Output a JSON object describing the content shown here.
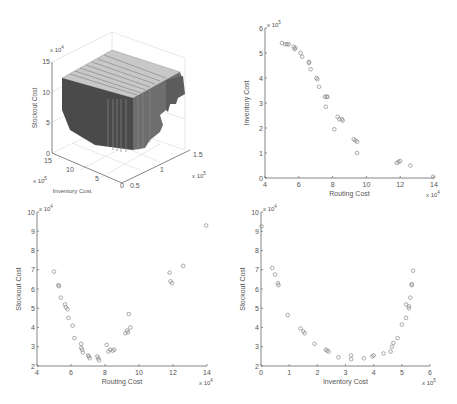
{
  "chart_data": [
    {
      "type": "surface3d",
      "title": "",
      "xlabel": "Inventory Cost",
      "ylabel": "Routing Cost",
      "zlabel": "Stockout Cost",
      "x_ticks": [
        "0",
        "5",
        "10",
        "15"
      ],
      "x_exponent": "x 10^5",
      "y_ticks": [
        "0.5",
        "1",
        "1.5"
      ],
      "y_exponent": "x 10^5",
      "z_ticks": [
        "0",
        "5",
        "10",
        "15"
      ],
      "z_exponent": "x 10^4",
      "grid": true,
      "description": "Stepped dark-gray 3D surface / block plot of Pareto front"
    },
    {
      "type": "scatter",
      "title": "",
      "xlabel": "Routing Cost",
      "ylabel": "Inventory Cost",
      "x_ticks": [
        "4",
        "6",
        "8",
        "10",
        "12",
        "14"
      ],
      "x_exponent": "x 10^4",
      "y_ticks": [
        "0",
        "1",
        "2",
        "3",
        "4",
        "5",
        "6"
      ],
      "y_exponent": "x 10^5",
      "xlim": [
        4,
        14
      ],
      "ylim": [
        0,
        6
      ],
      "grid": false,
      "marker": "circle-open",
      "points": [
        [
          5.0,
          5.4
        ],
        [
          5.2,
          5.35
        ],
        [
          5.3,
          5.35
        ],
        [
          5.4,
          5.35
        ],
        [
          5.7,
          5.25
        ],
        [
          5.8,
          5.2
        ],
        [
          5.75,
          5.15
        ],
        [
          6.1,
          5.0
        ],
        [
          6.2,
          4.85
        ],
        [
          6.6,
          4.65
        ],
        [
          6.6,
          4.6
        ],
        [
          6.7,
          4.35
        ],
        [
          7.05,
          4.0
        ],
        [
          7.1,
          3.95
        ],
        [
          7.2,
          3.65
        ],
        [
          7.55,
          3.25
        ],
        [
          7.65,
          3.25
        ],
        [
          7.7,
          3.25
        ],
        [
          7.6,
          2.85
        ],
        [
          8.3,
          2.45
        ],
        [
          8.4,
          2.35
        ],
        [
          8.55,
          2.35
        ],
        [
          8.6,
          2.3
        ],
        [
          8.1,
          1.95
        ],
        [
          9.25,
          1.55
        ],
        [
          9.35,
          1.5
        ],
        [
          9.45,
          1.45
        ],
        [
          9.45,
          1.0
        ],
        [
          11.8,
          0.6
        ],
        [
          11.9,
          0.65
        ],
        [
          12.0,
          0.68
        ],
        [
          12.6,
          0.5
        ],
        [
          13.95,
          0.05
        ]
      ]
    },
    {
      "type": "scatter",
      "title": "",
      "xlabel": "Routing Cost",
      "ylabel": "Stockout Cost",
      "x_ticks": [
        "4",
        "6",
        "8",
        "10",
        "12",
        "14"
      ],
      "x_exponent": "x 10^4",
      "y_ticks": [
        "2",
        "3",
        "4",
        "5",
        "6",
        "7",
        "8",
        "9",
        "10"
      ],
      "y_exponent": "x 10^4",
      "xlim": [
        4,
        14
      ],
      "ylim": [
        2,
        10
      ],
      "grid": false,
      "marker": "circle-open",
      "points": [
        [
          5.0,
          6.9
        ],
        [
          5.25,
          6.2
        ],
        [
          5.3,
          6.15
        ],
        [
          5.4,
          5.55
        ],
        [
          5.65,
          5.2
        ],
        [
          5.7,
          5.05
        ],
        [
          5.8,
          4.95
        ],
        [
          5.85,
          4.5
        ],
        [
          6.1,
          4.1
        ],
        [
          6.2,
          3.45
        ],
        [
          6.6,
          3.15
        ],
        [
          6.6,
          2.95
        ],
        [
          6.65,
          2.85
        ],
        [
          6.7,
          2.7
        ],
        [
          7.0,
          2.55
        ],
        [
          7.05,
          2.5
        ],
        [
          7.1,
          2.4
        ],
        [
          7.55,
          2.5
        ],
        [
          7.6,
          2.4
        ],
        [
          7.65,
          2.3
        ],
        [
          8.1,
          3.1
        ],
        [
          8.2,
          2.75
        ],
        [
          8.3,
          2.85
        ],
        [
          8.45,
          2.8
        ],
        [
          8.55,
          2.85
        ],
        [
          9.2,
          3.7
        ],
        [
          9.3,
          3.85
        ],
        [
          9.35,
          3.75
        ],
        [
          9.4,
          4.7
        ],
        [
          9.5,
          4.0
        ],
        [
          11.8,
          6.85
        ],
        [
          11.85,
          6.4
        ],
        [
          11.95,
          6.3
        ],
        [
          12.6,
          7.2
        ],
        [
          13.95,
          9.3
        ]
      ]
    },
    {
      "type": "scatter",
      "title": "",
      "xlabel": "Inventory Cost",
      "ylabel": "Stockout Cost",
      "x_ticks": [
        "0",
        "1",
        "2",
        "3",
        "4",
        "5",
        "6"
      ],
      "x_exponent": "x 10^5",
      "y_ticks": [
        "2",
        "3",
        "4",
        "5",
        "6",
        "7",
        "8",
        "9",
        "10"
      ],
      "y_exponent": "x 10^4",
      "xlim": [
        0,
        6
      ],
      "ylim": [
        2,
        10
      ],
      "grid": false,
      "marker": "circle-open",
      "points": [
        [
          0.02,
          9.25
        ],
        [
          0.4,
          7.1
        ],
        [
          0.5,
          6.75
        ],
        [
          0.6,
          6.3
        ],
        [
          0.62,
          6.2
        ],
        [
          0.95,
          4.65
        ],
        [
          1.4,
          3.95
        ],
        [
          1.5,
          3.8
        ],
        [
          1.55,
          3.7
        ],
        [
          1.9,
          3.15
        ],
        [
          2.3,
          2.85
        ],
        [
          2.35,
          2.8
        ],
        [
          2.4,
          2.75
        ],
        [
          2.75,
          2.45
        ],
        [
          3.2,
          2.55
        ],
        [
          3.2,
          2.35
        ],
        [
          3.65,
          2.4
        ],
        [
          3.95,
          2.5
        ],
        [
          4.0,
          2.55
        ],
        [
          4.35,
          2.65
        ],
        [
          4.6,
          2.75
        ],
        [
          4.65,
          3.0
        ],
        [
          4.7,
          3.2
        ],
        [
          4.85,
          3.45
        ],
        [
          5.0,
          4.15
        ],
        [
          5.15,
          4.5
        ],
        [
          5.15,
          5.2
        ],
        [
          5.25,
          5.0
        ],
        [
          5.25,
          5.1
        ],
        [
          5.3,
          5.55
        ],
        [
          5.35,
          6.2
        ],
        [
          5.35,
          6.25
        ],
        [
          5.4,
          6.95
        ]
      ]
    }
  ],
  "panels": {
    "surface": {
      "zlabel": "Stockout Cost",
      "xlabel": "Inventory Cost",
      "z_exp": "x 10",
      "z_exp_sup": "4",
      "x_exp": "x 10",
      "x_exp_sup": "5",
      "y_exp": "x 10",
      "y_exp_sup": "5",
      "z_ticks": [
        "0",
        "5",
        "10",
        "15"
      ],
      "x_ticks": [
        "15",
        "10",
        "5",
        "0"
      ],
      "y_ticks": [
        "0.5",
        "1",
        "1.5"
      ]
    },
    "top_right": {
      "xlabel": "Routing Cost",
      "ylabel": "Inventory Cost",
      "x_exp": "x 10",
      "x_exp_sup": "4",
      "y_exp": "x 10",
      "y_exp_sup": "5"
    },
    "bottom_left": {
      "xlabel": "Routing Cost",
      "ylabel": "Stockout Cost",
      "x_exp": "x 10",
      "x_exp_sup": "4",
      "y_exp": "x 10",
      "y_exp_sup": "4"
    },
    "bottom_right": {
      "xlabel": "Inventory Cost",
      "ylabel": "Stockout Cost",
      "x_exp": "x 10",
      "x_exp_sup": "5",
      "y_exp": "x 10",
      "y_exp_sup": "4"
    }
  },
  "colors": {
    "axis": "#777777",
    "marker": "#888888",
    "surface_dark": "#4a4a4a",
    "surface_mid": "#6e6e6e",
    "surface_light": "#c8c8c8",
    "grid": "#e2e2e2"
  },
  "caption": "Figure: Pareto front projections (partially cut off)"
}
